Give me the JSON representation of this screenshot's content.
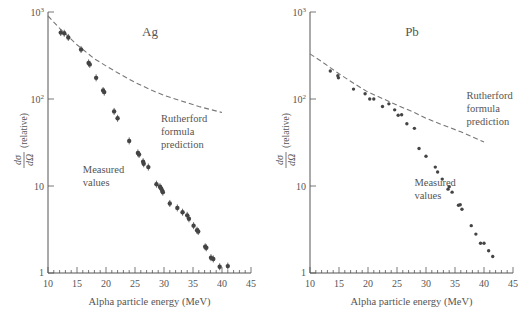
{
  "chart_data": [
    {
      "type": "scatter",
      "title": "Ag",
      "xlabel": "Alpha particle energy (MeV)",
      "ylabel": "dσ/dΩ (relative)",
      "yscale": "log",
      "xlim": [
        10,
        45
      ],
      "ylim": [
        1,
        1000
      ],
      "xticks": [
        "10",
        "15",
        "20",
        "25",
        "30",
        "35",
        "40",
        "45"
      ],
      "yticks": [
        "1",
        "10",
        "10²",
        "10³"
      ],
      "grid": false,
      "annotations": [
        {
          "text": [
            "Rutherford",
            "formula",
            "prediction"
          ],
          "x": 29.5,
          "y": 55
        },
        {
          "text": [
            "Measured",
            "values"
          ],
          "x": 16,
          "y": 14
        }
      ],
      "series": [
        {
          "name": "Rutherford formula prediction",
          "style": "dashed",
          "x": [
            10,
            12,
            15,
            18,
            20,
            22,
            25,
            28,
            30,
            33,
            36,
            40
          ],
          "y": [
            900,
            650,
            420,
            290,
            240,
            200,
            155,
            125,
            110,
            95,
            82,
            70
          ]
        },
        {
          "name": "Measured values",
          "style": "points",
          "x": [
            12.2,
            12.8,
            13.5,
            15.7,
            17.0,
            17.2,
            18.3,
            19.5,
            19.7,
            21.4,
            22.0,
            24.0,
            25.5,
            25.7,
            26.4,
            26.5,
            27.3,
            28.7,
            29.3,
            29.5,
            29.7,
            29.8,
            31.0,
            32.3,
            33.2,
            34.0,
            34.3,
            35.1,
            35.7,
            35.9,
            37.1,
            37.3,
            38.1,
            38.5,
            39.6,
            41.0
          ],
          "y": [
            580,
            570,
            510,
            370,
            260,
            250,
            175,
            125,
            120,
            72,
            60,
            33,
            24,
            23,
            19,
            18,
            16.5,
            10.5,
            9.8,
            9.4,
            8.8,
            8.5,
            6.3,
            5.6,
            5.0,
            4.6,
            4.2,
            3.5,
            3.1,
            3.0,
            2.0,
            1.95,
            1.5,
            1.45,
            1.18,
            1.2
          ]
        }
      ]
    },
    {
      "type": "scatter",
      "title": "Pb",
      "xlabel": "Alpha particle energy (MeV)",
      "ylabel": "dσ/dΩ (relative)",
      "yscale": "log",
      "xlim": [
        10,
        45
      ],
      "ylim": [
        1,
        1000
      ],
      "xticks": [
        "10",
        "15",
        "20",
        "25",
        "30",
        "35",
        "40",
        "45"
      ],
      "yticks": [
        "1",
        "10",
        "10²",
        "10³"
      ],
      "grid": false,
      "annotations": [
        {
          "text": [
            "Rutherford",
            "formula",
            "prediction"
          ],
          "x": 37,
          "y": 100
        },
        {
          "text": [
            "Measured",
            "values"
          ],
          "x": 28,
          "y": 10
        }
      ],
      "series": [
        {
          "name": "Rutherford formula prediction",
          "style": "dashed",
          "x": [
            10,
            12,
            15,
            18,
            20,
            22,
            25,
            28,
            30,
            33,
            36,
            40
          ],
          "y": [
            330,
            270,
            195,
            145,
            120,
            105,
            85,
            70,
            60,
            50,
            42,
            32
          ]
        },
        {
          "name": "Measured values",
          "style": "points",
          "x": [
            13.5,
            14.8,
            14.9,
            17.5,
            19.5,
            20.3,
            21.0,
            22.5,
            23.6,
            24.6,
            25.2,
            25.8,
            26.7,
            28.0,
            28.8,
            30.0,
            31.6,
            32.0,
            32.8,
            33.8,
            34.0,
            34.5,
            35.6,
            35.9,
            36.2,
            37.8,
            38.6,
            39.4,
            40.0,
            40.8,
            41.5
          ],
          "y": [
            210,
            185,
            175,
            130,
            115,
            100,
            100,
            82,
            88,
            75,
            65,
            66,
            52,
            46,
            27,
            22,
            16.5,
            14.5,
            12,
            9.2,
            9.8,
            8.5,
            6.0,
            6.1,
            5.4,
            3.5,
            2.8,
            2.2,
            2.2,
            1.8,
            1.55
          ]
        }
      ]
    }
  ]
}
